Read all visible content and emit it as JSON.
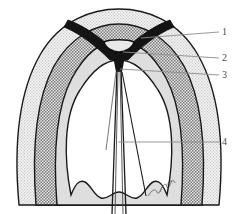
{
  "figure": {
    "background_color": "#ffffff",
    "signature_mark": "artist-initials-scribble"
  },
  "labels": [
    {
      "id": "1",
      "text": "1",
      "target": "outer-wall-layer",
      "leader_from_x": 141,
      "leader_from_y": 38,
      "leader_to_x": 219,
      "leader_to_y": 32
    },
    {
      "id": "2",
      "text": "2",
      "target": "dark-v-structure-apex",
      "leader_from_x": 123,
      "leader_from_y": 52,
      "leader_to_x": 219,
      "leader_to_y": 58
    },
    {
      "id": "3",
      "text": "3",
      "target": "central-junction",
      "leader_from_x": 120,
      "leader_from_y": 69,
      "leader_to_x": 219,
      "leader_to_y": 75
    },
    {
      "id": "4",
      "text": "4",
      "target": "central-canal",
      "leader_from_x": 118,
      "leader_from_y": 142,
      "leader_to_x": 219,
      "leader_to_y": 142
    }
  ],
  "colors": {
    "outline": "#1a1a1a",
    "leader_line": "#808080",
    "label_text": "#4a4a4a",
    "outer_band_fill": "#ededed",
    "stippled_band_fill": "#b5b5b5",
    "inner_band_fill": "#d8d8d8",
    "cavity_fill": "#ffffff",
    "dark_structure_fill": "#141414",
    "background": "#ffffff"
  },
  "structures": [
    {
      "name": "outer-wall-layer",
      "shading": "light-gray",
      "label_ref": "1"
    },
    {
      "name": "stippled-muscular-layer",
      "shading": "medium-gray-stipple",
      "label_ref": null
    },
    {
      "name": "inner-mucosal-layer",
      "shading": "light-gray",
      "label_ref": null
    },
    {
      "name": "dark-v-structure",
      "shading": "solid-black",
      "label_ref": "2"
    },
    {
      "name": "central-junction",
      "shading": "solid-black",
      "label_ref": "3"
    },
    {
      "name": "central-canal",
      "shading": "white-outline",
      "label_ref": "4"
    },
    {
      "name": "inner-cavity-lobe",
      "shading": "white",
      "label_ref": null
    }
  ]
}
